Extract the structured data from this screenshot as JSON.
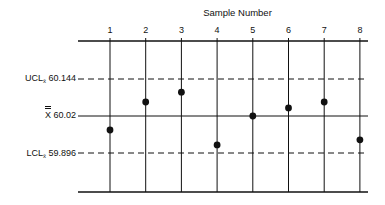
{
  "chart_data": {
    "type": "scatter",
    "title": "Sample Number",
    "xlabel": "Sample Number",
    "ylabel": "",
    "x": [
      1,
      2,
      3,
      4,
      5,
      6,
      7,
      8
    ],
    "series": [
      {
        "name": "Sample means",
        "values": [
          59.973,
          60.067,
          60.1,
          59.923,
          60.02,
          60.047,
          60.067,
          59.94
        ]
      }
    ],
    "reference_lines": [
      {
        "name": "UCL",
        "label": "UCL",
        "subscript": "x̄",
        "value": 60.144,
        "style": "dashed"
      },
      {
        "name": "Center line",
        "label": "X̿",
        "value": 60.02,
        "style": "solid"
      },
      {
        "name": "LCL",
        "label": "LCL",
        "subscript": "x̄",
        "value": 59.896,
        "style": "dashed"
      }
    ],
    "x_tick_position": "top",
    "grid": "vertical lines at each sample",
    "legend": "none"
  },
  "labels": {
    "title": "Sample Number",
    "ticks": [
      "1",
      "2",
      "3",
      "4",
      "5",
      "6",
      "7",
      "8"
    ],
    "ucl_prefix": "UCL",
    "ucl_sub": "x̄",
    "ucl_value": "60.144",
    "cl_symbol": "X",
    "cl_value": "60.02",
    "lcl_prefix": "LCL",
    "lcl_sub": "x̄",
    "lcl_value": "59.896"
  },
  "colors": {
    "ink": "#111111",
    "background": "#ffffff"
  }
}
